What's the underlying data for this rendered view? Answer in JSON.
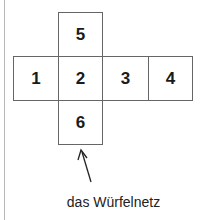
{
  "diagram": {
    "title": "das Würfelnetz",
    "faces": [
      {
        "id": "face-5",
        "label": "5",
        "x": 58,
        "y": 12,
        "w": 44,
        "h": 44
      },
      {
        "id": "face-1",
        "label": "1",
        "x": 13,
        "y": 56,
        "w": 46,
        "h": 44
      },
      {
        "id": "face-2",
        "label": "2",
        "x": 58,
        "y": 56,
        "w": 45,
        "h": 44
      },
      {
        "id": "face-3",
        "label": "3",
        "x": 102,
        "y": 56,
        "w": 47,
        "h": 44
      },
      {
        "id": "face-4",
        "label": "4",
        "x": 148,
        "y": 56,
        "w": 45,
        "h": 44
      },
      {
        "id": "face-6",
        "label": "6",
        "x": 58,
        "y": 100,
        "w": 44,
        "h": 44
      }
    ],
    "arrow": {
      "from": [
        91,
        182
      ],
      "to": [
        81,
        150
      ]
    },
    "colors": {
      "border": "#666666",
      "text": "#1a1a1a",
      "margin_line": "#b8b8b8"
    }
  }
}
